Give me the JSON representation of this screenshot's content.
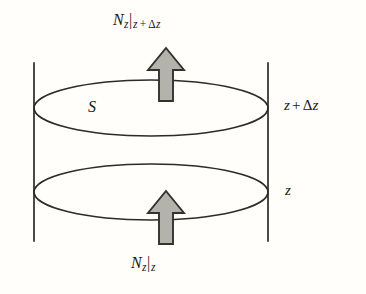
{
  "figure": {
    "background_color": "#fffefa",
    "stroke_color": "#2b2b28",
    "arrow_fill_color": "#b3b2ab",
    "arrow_outline_color": "#33332e"
  },
  "labels": {
    "flux_top": {
      "symbol": "N",
      "symbol_sub": "z",
      "evaluated_at_bar": "|",
      "at_position": "z",
      "plus": "+",
      "delta": "Δ",
      "delta_var": "z",
      "full_text": "N_z|_{z+Δz}"
    },
    "flux_bottom": {
      "symbol": "N",
      "symbol_sub": "z",
      "evaluated_at_bar": "|",
      "at_position": "z",
      "full_text": "N_z|_z"
    },
    "top_position": {
      "var": "z",
      "plus": "+",
      "delta": "Δ",
      "delta_var": "z",
      "full_text": "z + Δz"
    },
    "bottom_position": {
      "var": "z",
      "full_text": "z"
    },
    "area": {
      "symbol": "S",
      "full_text": "S"
    }
  },
  "geometry": {
    "cylinder_left_x": 34,
    "cylinder_right_x": 268,
    "wall_top_y": 63,
    "wall_bottom_y": 241,
    "top_ellipse_center_y": 108,
    "bottom_ellipse_center_y": 192,
    "ellipse_rx": 117,
    "ellipse_ry": 28,
    "arrow_top": {
      "tip_y": 48,
      "tail_y": 101,
      "center_x": 166,
      "shaft_half_width": 9,
      "head_half_width": 18
    },
    "arrow_bottom": {
      "tip_y": 191,
      "tail_y": 244,
      "center_x": 166,
      "shaft_half_width": 9,
      "head_half_width": 18
    }
  }
}
